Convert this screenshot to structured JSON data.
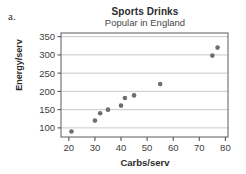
{
  "figure": {
    "part_label": "a.",
    "title": "Sports Drinks",
    "subtitle": "Popular in England",
    "xlabel": "Carbs/serv",
    "ylabel": "Energy/serv"
  },
  "colors": {
    "point": "#6e6e6e",
    "axis": "#555555",
    "grid": "#c9c9c9",
    "frame": "#6b6b6b",
    "text": "#3a3a3a",
    "title": "#2b2b2b",
    "background": "#ffffff"
  },
  "chart_data": {
    "type": "scatter",
    "title": "Sports Drinks",
    "subtitle": "Popular in England",
    "xlabel": "Carbs/serv",
    "ylabel": "Energy/serv",
    "xlim": [
      17,
      81
    ],
    "ylim": [
      75,
      360
    ],
    "xticks": [
      20,
      30,
      40,
      50,
      60,
      70,
      80
    ],
    "yticks": [
      100,
      150,
      200,
      250,
      300,
      350
    ],
    "xtick_labels": [
      "20",
      "30",
      "40",
      "50",
      "60",
      "70",
      "80"
    ],
    "ytick_labels": [
      "100",
      "150",
      "200",
      "250",
      "300",
      "350"
    ],
    "grid": "horizontal",
    "legend": null,
    "series": [
      {
        "name": "Sports drinks",
        "x": [
          21,
          30,
          32,
          35,
          40,
          41.5,
          45,
          55,
          75,
          77
        ],
        "y": [
          90,
          120,
          140,
          150,
          161,
          182,
          189,
          220,
          298,
          320
        ]
      }
    ],
    "points": [
      {
        "x": 21,
        "y": 90
      },
      {
        "x": 30,
        "y": 120
      },
      {
        "x": 32,
        "y": 140
      },
      {
        "x": 35,
        "y": 150
      },
      {
        "x": 40,
        "y": 161
      },
      {
        "x": 41.5,
        "y": 182
      },
      {
        "x": 45,
        "y": 189
      },
      {
        "x": 55,
        "y": 220
      },
      {
        "x": 75,
        "y": 298
      },
      {
        "x": 77,
        "y": 320
      }
    ]
  }
}
